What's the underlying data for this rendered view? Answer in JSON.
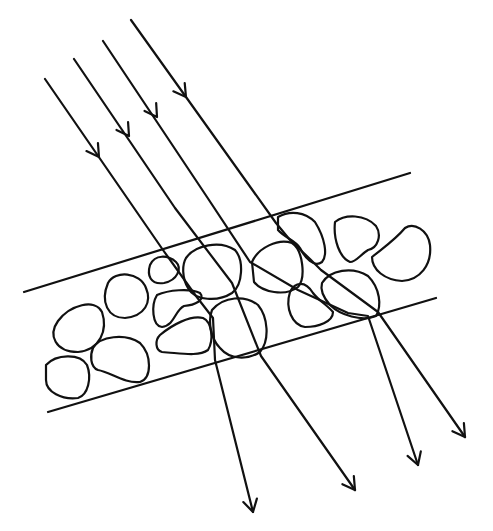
{
  "colors": {
    "background": "#ffffff",
    "ink": "#111111"
  },
  "diagram": {
    "type": "ray-scattering-schematic",
    "slab": {
      "top_edge": [
        [
          24,
          292
        ],
        [
          410,
          173
        ]
      ],
      "bottom_edge": [
        [
          48,
          412
        ],
        [
          436,
          298
        ]
      ]
    },
    "incident_rays": [
      {
        "id": "ray-1",
        "path": [
          [
            45,
            79
          ],
          [
            163,
            250
          ],
          [
            196,
            296
          ],
          [
            213,
            318
          ],
          [
            215,
            360
          ],
          [
            253,
            512
          ]
        ],
        "arrow_in": [
          99,
          157
        ],
        "arrow_out": [
          253,
          512
        ]
      },
      {
        "id": "ray-2",
        "path": [
          [
            74,
            59
          ],
          [
            175,
            208
          ],
          [
            232,
            283
          ],
          [
            261,
            356
          ],
          [
            355,
            490
          ]
        ],
        "arrow_in": [
          129,
          136
        ],
        "arrow_out": [
          355,
          490
        ]
      },
      {
        "id": "ray-3",
        "path": [
          [
            103,
            41
          ],
          [
            207,
            197
          ],
          [
            250,
            262
          ],
          [
            298,
            290
          ],
          [
            348,
            313
          ],
          [
            368,
            316
          ],
          [
            418,
            465
          ]
        ],
        "arrow_in": [
          157,
          117
        ],
        "arrow_out": [
          418,
          465
        ]
      },
      {
        "id": "ray-4",
        "path": [
          [
            131,
            20
          ],
          [
            276,
            223
          ],
          [
            290,
            240
          ],
          [
            310,
            259
          ],
          [
            321,
            270
          ],
          [
            378,
            312
          ],
          [
            465,
            437
          ]
        ],
        "arrow_in": [
          186,
          97
        ],
        "arrow_out": [
          465,
          437
        ]
      }
    ],
    "particles": [
      "M58,321 C70,305 95,298 102,312 C108,330 100,350 78,352 C55,352 48,335 58,321 Z",
      "M108,283 C115,270 140,272 146,288 C152,302 145,316 125,318 C108,318 100,302 108,283 Z",
      "M150,265 C155,254 168,255 176,262 C182,268 178,280 164,283 C150,285 147,275 150,265 Z",
      "M157,295 C168,290 190,288 200,293 C206,300 195,305 184,306 C175,310 175,325 162,327 C152,326 151,305 157,295 Z",
      "M46,365 C56,354 80,353 87,365 C92,378 88,395 78,398 C62,400 46,392 46,380 Z",
      "M93,348 C100,336 125,333 140,343 C152,355 152,378 140,382 C125,384 110,372 98,370 C90,367 90,355 93,348 Z",
      "M160,335 C172,325 190,315 203,318 C212,322 214,340 208,350 C198,357 180,353 162,352 C155,350 155,340 160,335 Z",
      "M186,258 C195,245 220,240 235,250 C244,260 243,285 232,293 C218,302 195,301 188,288 C182,278 182,265 186,258 Z",
      "M212,310 C224,296 245,295 258,305 C268,317 270,340 260,352 C248,360 230,360 220,348 C210,338 208,320 212,310 Z",
      "M252,262 C258,248 278,238 292,243 C303,250 306,278 298,287 C285,297 262,292 254,282 Z",
      "M278,217 C290,210 305,212 315,222 C325,238 328,255 322,262 C314,268 305,258 300,248 C295,240 285,238 278,230 Z",
      "M335,222 C345,214 365,214 376,226 C382,235 378,248 368,250 C360,255 356,262 350,262 C340,258 333,240 335,222 Z",
      "M372,257 C383,248 395,240 405,228 C414,222 428,230 430,245 C432,265 420,280 402,281 C385,280 372,270 372,257 Z",
      "M290,292 C295,282 305,280 313,293 C318,300 327,305 333,312 C333,322 318,327 305,327 C292,325 285,308 290,292 Z",
      "M322,283 C330,270 352,266 368,276 C380,288 382,306 376,316 C362,322 340,315 330,305 C323,297 320,290 322,283 Z"
    ]
  }
}
